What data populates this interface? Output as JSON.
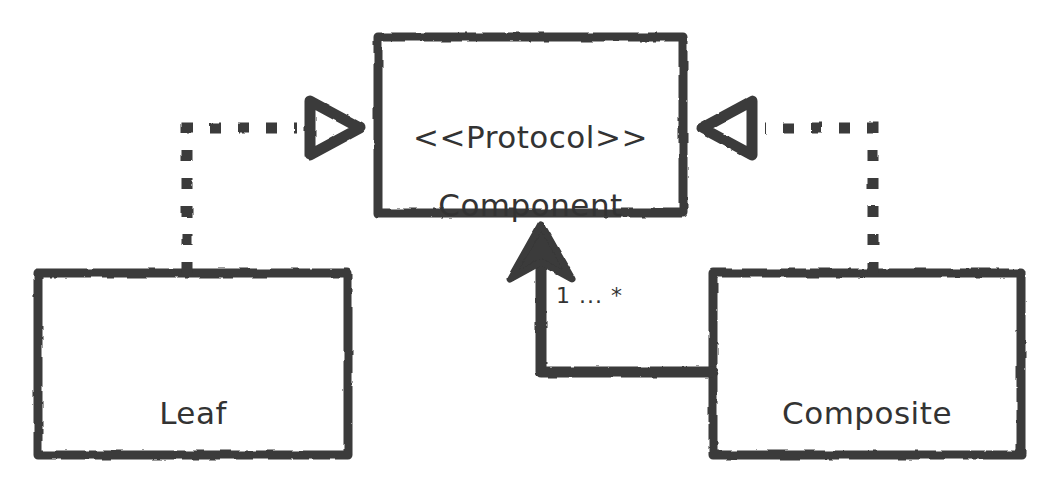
{
  "diagram": {
    "type": "uml-class-diagram",
    "stroke_color": "#3a3a3a",
    "text_color": "#333333",
    "background_color": "#ffffff",
    "nodes": [
      {
        "id": "component",
        "stereotype": "<<Protocol>>",
        "name": "Component",
        "x": 378,
        "y": 37,
        "width": 305,
        "height": 176
      },
      {
        "id": "leaf",
        "stereotype": "",
        "name": "Leaf",
        "x": 38,
        "y": 273,
        "width": 310,
        "height": 182
      },
      {
        "id": "composite",
        "stereotype": "",
        "name": "Composite",
        "x": 713,
        "y": 273,
        "width": 308,
        "height": 182
      }
    ],
    "edges": [
      {
        "id": "leaf-realizes-component",
        "from": "leaf",
        "to": "component",
        "style": "dashed",
        "arrowhead": "hollow-triangle",
        "label": ""
      },
      {
        "id": "composite-realizes-component",
        "from": "composite",
        "to": "component",
        "style": "dashed",
        "arrowhead": "hollow-triangle",
        "label": ""
      },
      {
        "id": "composite-aggregates-component",
        "from": "composite",
        "to": "component",
        "style": "solid",
        "arrowhead": "filled-arrow",
        "label": "1 ... *"
      }
    ]
  }
}
